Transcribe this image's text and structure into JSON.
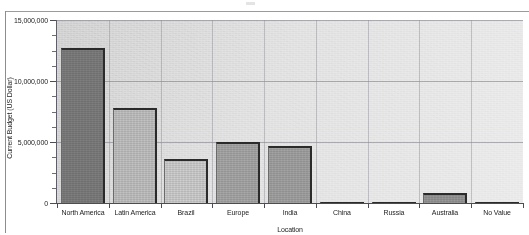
{
  "chart_data": {
    "type": "bar",
    "title": "",
    "xlabel": "Location",
    "ylabel": "Current Budget (US Dollar)",
    "categories": [
      "North America",
      "Latin America",
      "Brazil",
      "Europe",
      "India",
      "China",
      "Russia",
      "Australia",
      "No Value"
    ],
    "values": [
      12700000,
      7800000,
      3600000,
      5000000,
      4700000,
      30000,
      20000,
      850000,
      15000
    ],
    "ylim": [
      0,
      15000000
    ],
    "ytick_labels": [
      "0",
      "5,000,000",
      "10,000,000",
      "15,000,000"
    ],
    "ytick_values": [
      0,
      5000000,
      10000000,
      15000000
    ],
    "yminor_tick_values": [
      1250000,
      2500000,
      3750000,
      6250000,
      7500000,
      8750000,
      11250000,
      12500000,
      13750000
    ],
    "grid": "horizontal-and-vertical",
    "legend": "none",
    "bar_colors": [
      "#7e7e7e",
      "#c2c2c2",
      "#cfcfcf",
      "#a8a8a8",
      "#a3a3a3",
      "#b5b5b5",
      "#b5b5b5",
      "#989898",
      "#b5b5b5"
    ],
    "plot_background": "#d9d9d9",
    "axis_color": "#4c4c54"
  },
  "figure": {
    "background": "#ffffff",
    "frame_color": "#8c8c94"
  }
}
